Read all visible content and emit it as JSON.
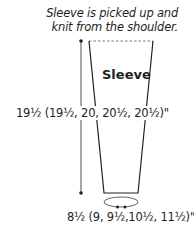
{
  "note": {
    "lines": [
      "Sleeve is picked up and",
      "knit from the shoulder."
    ]
  },
  "piece": {
    "label": "Sleeve"
  },
  "measurements": {
    "length": "19½ (19½, 20, 20½, 20½)\"",
    "cuff_circumference": "8½ (9, 9½,10½, 11½)\""
  },
  "colors": {
    "line": "#231f20",
    "dashed": "#555555",
    "background": "#ffffff"
  }
}
